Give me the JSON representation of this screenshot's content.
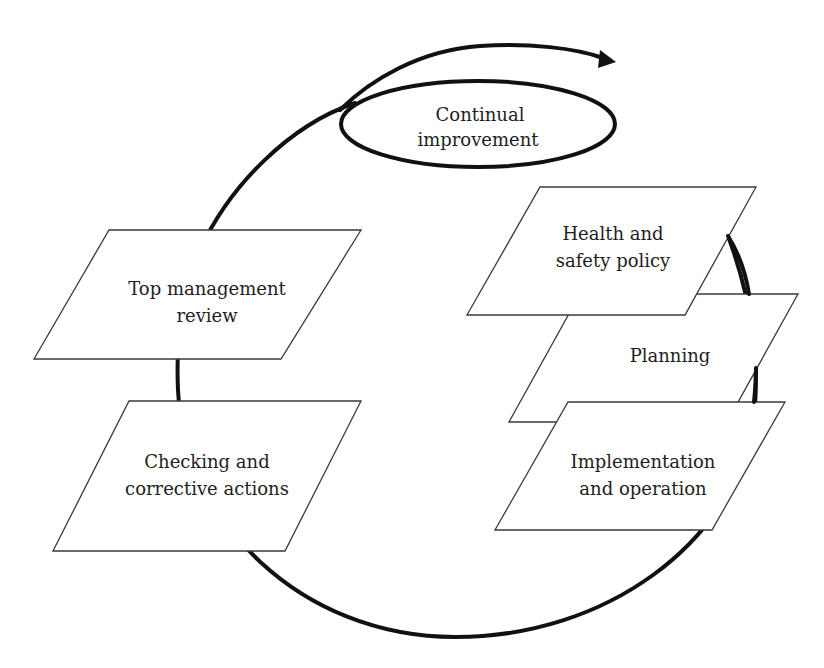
{
  "diagram": {
    "type": "cycle",
    "colors": {
      "line": "#111111",
      "shape_border": "#3a3a3a",
      "shape_fill": "#ffffff",
      "text": "#1e1e1e",
      "background": "#ffffff"
    },
    "center": {
      "label_line1": "Continual",
      "label_line2": "improvement"
    },
    "stages": [
      {
        "id": "policy",
        "line1": "Health and",
        "line2": "safety policy"
      },
      {
        "id": "planning",
        "line1": "Planning",
        "line2": ""
      },
      {
        "id": "implementation",
        "line1": "Implementation",
        "line2": "and operation"
      },
      {
        "id": "checking",
        "line1": "Checking and",
        "line2": "corrective actions"
      },
      {
        "id": "review",
        "line1": "Top management",
        "line2": "review"
      }
    ],
    "arrow": {
      "direction": "clockwise",
      "icon": "arrowhead-right"
    }
  }
}
